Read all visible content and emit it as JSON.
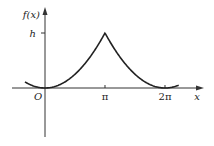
{
  "chart_data": {
    "type": "line",
    "title": "",
    "xlabel": "x",
    "ylabel": "f(x)",
    "origin_label": "O",
    "x_ticks": [
      {
        "value": 3.14159,
        "label": "π"
      },
      {
        "value": 6.28318,
        "label": "2π"
      }
    ],
    "y_ticks": [
      {
        "value": 1,
        "label": "h"
      }
    ],
    "xlim": [
      -1.05,
      7.0
    ],
    "ylim": [
      -1.0,
      1.55
    ],
    "grid": false,
    "legend": "none",
    "series": [
      {
        "name": "f(x)",
        "description": "periodic curve: minimum 0 at x=0 and x=2π, cusp peak h at x=π, concave-up arcs",
        "x": [
          -1.05,
          -0.7,
          -0.35,
          0,
          0.5,
          1.0,
          1.5,
          2.0,
          2.5,
          3.0,
          3.14159,
          3.3,
          3.8,
          4.3,
          4.8,
          5.3,
          5.8,
          6.28318,
          6.6,
          7.0
        ],
        "y": [
          0.29,
          0.13,
          0.03,
          0,
          0.025,
          0.1,
          0.23,
          0.41,
          0.63,
          0.91,
          1.0,
          0.91,
          0.63,
          0.41,
          0.23,
          0.1,
          0.025,
          0,
          0.05,
          0.13
        ]
      }
    ]
  }
}
